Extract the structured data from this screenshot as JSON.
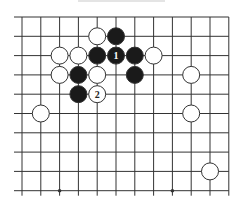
{
  "diagram": {
    "type": "go-board-fragment",
    "grid": {
      "columns": 12,
      "rows": 10,
      "x0": 22,
      "y0": 17,
      "dx": 18.8,
      "dy": 19.3,
      "left_stub": 14,
      "bottom_stub": 5,
      "line_color": "#333333"
    },
    "star_points": [
      {
        "col": 2,
        "row": 9
      },
      {
        "col": 8,
        "row": 9
      }
    ],
    "stones": [
      {
        "color": "white",
        "col": 4,
        "row": 1,
        "label": ""
      },
      {
        "color": "black",
        "col": 5,
        "row": 1,
        "label": ""
      },
      {
        "color": "white",
        "col": 2,
        "row": 2,
        "label": ""
      },
      {
        "color": "white",
        "col": 3,
        "row": 2,
        "label": ""
      },
      {
        "color": "black",
        "col": 4,
        "row": 2,
        "label": ""
      },
      {
        "color": "black",
        "col": 5,
        "row": 2,
        "label": "1"
      },
      {
        "color": "black",
        "col": 6,
        "row": 2,
        "label": ""
      },
      {
        "color": "white",
        "col": 7,
        "row": 2,
        "label": ""
      },
      {
        "color": "white",
        "col": 2,
        "row": 3,
        "label": ""
      },
      {
        "color": "black",
        "col": 3,
        "row": 3,
        "label": ""
      },
      {
        "color": "white",
        "col": 4,
        "row": 3,
        "label": ""
      },
      {
        "color": "black",
        "col": 6,
        "row": 3,
        "label": ""
      },
      {
        "color": "white",
        "col": 9,
        "row": 3,
        "label": ""
      },
      {
        "color": "black",
        "col": 3,
        "row": 4,
        "label": ""
      },
      {
        "color": "white",
        "col": 4,
        "row": 4,
        "label": "2"
      },
      {
        "color": "white",
        "col": 1,
        "row": 5,
        "label": ""
      },
      {
        "color": "white",
        "col": 9,
        "row": 5,
        "label": ""
      },
      {
        "color": "white",
        "col": 10,
        "row": 8,
        "label": ""
      }
    ],
    "colors": {
      "black_stone": "#1a1a1a",
      "white_stone": "#ffffff",
      "stone_outline": "#333333",
      "label_on_black": "#ffffff",
      "label_on_white": "#222222"
    },
    "stone_radius": 8.5
  }
}
